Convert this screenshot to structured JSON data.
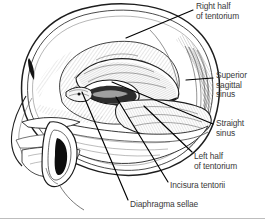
{
  "figure": {
    "style": "pen-and-ink line drawing with cross-hatch shading",
    "background_color": "#ffffff",
    "ink_color": "#1a1a1a",
    "shading_color": "#6b6b6b",
    "text_color": "#3a3a3a",
    "leader_line_color": "#000000"
  },
  "labels": [
    {
      "id": "right-half-of-tentorium",
      "text": "Right half\nof tentorium",
      "lines": [
        "Right half",
        "of tentorium"
      ],
      "position": "top-right",
      "leader_target": "right leaf of the tentorium, superior surface"
    },
    {
      "id": "superior-sagittal-sinus",
      "text": "Superior\nsagittal\nsinus",
      "lines": [
        "Superior",
        "sagittal",
        "sinus"
      ],
      "position": "right-upper",
      "leader_target": "posterior margin of the cranial vault midline"
    },
    {
      "id": "straight-sinus",
      "text": "Straight\nsinus",
      "lines": [
        "Straight",
        "sinus"
      ],
      "position": "right-middle",
      "leader_target": "junction of falx cerebri and tentorium"
    },
    {
      "id": "left-half-of-tentorium",
      "text": "Left half\nof tentorium",
      "lines": [
        "Left half",
        "of tentorium"
      ],
      "position": "right-lower",
      "leader_target": "left leaf of the tentorium"
    },
    {
      "id": "incisura-tentorii",
      "text": "Incisura tentorii",
      "lines": [
        "Incisura tentorii"
      ],
      "position": "bottom-right",
      "leader_target": "free tentorial notch around the midbrain"
    },
    {
      "id": "diaphragma-sellae",
      "text": "Diaphragma sellae",
      "lines": [
        "Diaphragma sellae"
      ],
      "position": "bottom-center",
      "leader_target": "roof of the sella turcica"
    }
  ],
  "anatomy_parts": [
    "cranial vault outline",
    "inner table of skull",
    "tentorium cerebelli right half",
    "tentorium cerebelli left half",
    "incisura tentorii",
    "diaphragma sellae",
    "superior sagittal sinus",
    "straight sinus",
    "falx cerebri",
    "external ear (auricle)",
    "external acoustic meatus",
    "facial profile",
    "zygomatic arch",
    "mandible"
  ]
}
